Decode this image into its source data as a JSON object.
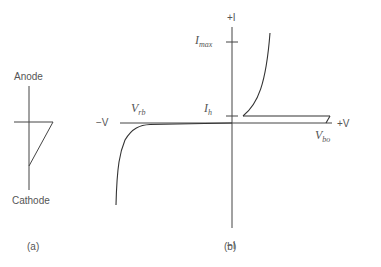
{
  "figure_a": {
    "caption": "(a)",
    "anode_label": "Anode",
    "cathode_label": "Cathode"
  },
  "figure_b": {
    "caption": "(b)",
    "axis_labels": {
      "pos_current": "+I",
      "neg_current": "−I",
      "pos_voltage": "+V",
      "neg_voltage": "−V"
    },
    "annotations": {
      "imax_main": "I",
      "imax_sub": "max",
      "ih_main": "I",
      "ih_sub": "h",
      "vrb_main": "V",
      "vrb_sub": "rb",
      "vbo_main": "V",
      "vbo_sub": "bo"
    }
  },
  "colors": {
    "line": "#444444",
    "text": "#555555"
  }
}
